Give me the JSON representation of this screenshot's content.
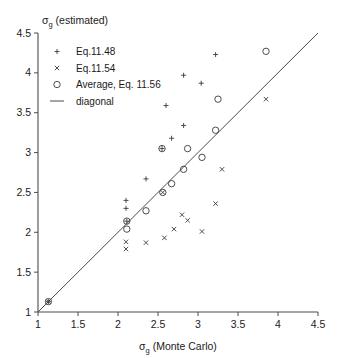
{
  "chart_data": {
    "type": "scatter",
    "title": "",
    "xlabel": "σg (Monte Carlo)",
    "xlabel_base": "σ",
    "xlabel_sub": "g",
    "xlabel_rest": " (Monte Carlo)",
    "ylabel": "σg (estimated)",
    "ylabel_base": "σ",
    "ylabel_sub": "g",
    "ylabel_rest": " (estimated)",
    "xlim": [
      1,
      4.5
    ],
    "ylim": [
      1,
      4.5
    ],
    "xticks": [
      "1",
      "1.5",
      "2",
      "2.5",
      "3",
      "3.5",
      "4",
      "4.5"
    ],
    "xtick_values": [
      1,
      1.5,
      2,
      2.5,
      3,
      3.5,
      4,
      4.5
    ],
    "yticks": [
      "1",
      "1.5",
      "2",
      "2.5",
      "3",
      "3.5",
      "4",
      "4.5"
    ],
    "ytick_values": [
      1,
      1.5,
      2,
      2.5,
      3,
      3.5,
      4,
      4.5
    ],
    "grid": false,
    "legend_position": "upper-left",
    "legend": [
      {
        "label": "Eq.11.48",
        "marker": "plus"
      },
      {
        "label": "Eq.11.54",
        "marker": "cross"
      },
      {
        "label": "Average, Eq. 11.56",
        "marker": "circle"
      },
      {
        "label": "diagonal",
        "marker": "line"
      }
    ],
    "series": [
      {
        "name": "Eq.11.48",
        "marker": "plus",
        "points": [
          [
            1.13,
            1.13
          ],
          [
            2.1,
            2.4
          ],
          [
            2.1,
            2.3
          ],
          [
            2.11,
            2.14
          ],
          [
            2.35,
            2.67
          ],
          [
            2.55,
            3.05
          ],
          [
            2.6,
            3.59
          ],
          [
            2.67,
            3.18
          ],
          [
            2.82,
            3.34
          ],
          [
            2.82,
            3.97
          ],
          [
            3.04,
            3.87
          ],
          [
            3.22,
            4.23
          ]
        ]
      },
      {
        "name": "Eq.11.54",
        "marker": "cross",
        "points": [
          [
            1.13,
            1.13
          ],
          [
            2.1,
            1.88
          ],
          [
            2.1,
            1.79
          ],
          [
            2.35,
            1.87
          ],
          [
            2.56,
            2.5
          ],
          [
            2.58,
            1.93
          ],
          [
            2.7,
            2.04
          ],
          [
            2.8,
            2.22
          ],
          [
            2.87,
            2.15
          ],
          [
            3.05,
            2.01
          ],
          [
            3.22,
            2.36
          ],
          [
            3.3,
            2.79
          ],
          [
            3.85,
            3.67
          ]
        ]
      },
      {
        "name": "Average, Eq. 11.56",
        "marker": "circle",
        "points": [
          [
            1.13,
            1.13
          ],
          [
            2.11,
            2.14
          ],
          [
            2.11,
            2.04
          ],
          [
            2.35,
            2.27
          ],
          [
            2.55,
            3.05
          ],
          [
            2.56,
            2.5
          ],
          [
            2.67,
            2.61
          ],
          [
            2.82,
            2.79
          ],
          [
            2.87,
            3.05
          ],
          [
            3.05,
            2.94
          ],
          [
            3.22,
            3.28
          ],
          [
            3.25,
            3.67
          ],
          [
            3.85,
            4.27
          ]
        ]
      }
    ],
    "reference_line": {
      "name": "diagonal",
      "from": [
        1,
        1
      ],
      "to": [
        4.5,
        4.5
      ]
    }
  },
  "colors": {
    "axis": "#4d4d4d",
    "marker": "#3a3a3a",
    "background": "#ffffff",
    "text": "#1a1a1a"
  }
}
